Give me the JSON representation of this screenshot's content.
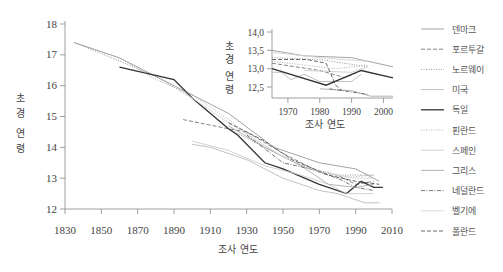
{
  "chart_data": [
    {
      "type": "line",
      "title": "",
      "xlabel": "조사 연도",
      "ylabel": "초경 연령",
      "xlim": [
        1830,
        2010
      ],
      "ylim": [
        12,
        18
      ],
      "x_ticks": [
        1830,
        1850,
        1870,
        1890,
        1910,
        1930,
        1950,
        1970,
        1990,
        2010
      ],
      "y_ticks": [
        12,
        13,
        14,
        15,
        16,
        17,
        18
      ],
      "grid": false,
      "legend_position": "right",
      "series": [
        {
          "name": "덴마크",
          "style": "solid",
          "color": "#9a9a9a",
          "points": [
            [
              1835,
              17.4
            ],
            [
              1860,
              16.9
            ],
            [
              1890,
              16.0
            ],
            [
              1920,
              15.1
            ],
            [
              1945,
              14.0
            ],
            [
              1950,
              13.9
            ],
            [
              1970,
              13.5
            ],
            [
              1990,
              13.3
            ],
            [
              2003,
              12.9
            ]
          ]
        },
        {
          "name": "포르투갈",
          "style": "dashed",
          "color": "#777777",
          "points": [
            [
              1895,
              14.9
            ],
            [
              1920,
              14.6
            ],
            [
              1930,
              14.5
            ],
            [
              1950,
              13.8
            ],
            [
              1970,
              13.2
            ],
            [
              1980,
              13.1
            ],
            [
              1990,
              12.8
            ],
            [
              2000,
              12.9
            ]
          ]
        },
        {
          "name": "노르웨이",
          "style": "dotted",
          "color": "#888888",
          "points": [
            [
              1835,
              17.4
            ],
            [
              1860,
              16.8
            ],
            [
              1880,
              16.3
            ],
            [
              1900,
              15.6
            ],
            [
              1920,
              14.6
            ],
            [
              1940,
              14.0
            ],
            [
              1960,
              13.4
            ],
            [
              1980,
              13.1
            ],
            [
              2000,
              13.1
            ]
          ]
        },
        {
          "name": "미국",
          "style": "solid",
          "color": "#bbbbbb",
          "points": [
            [
              1900,
              14.1
            ],
            [
              1910,
              14.0
            ],
            [
              1930,
              13.6
            ],
            [
              1950,
              13.0
            ],
            [
              1970,
              12.6
            ],
            [
              1980,
              12.5
            ],
            [
              1995,
              12.2
            ],
            [
              2003,
              12.2
            ]
          ]
        },
        {
          "name": "독일",
          "style": "solid",
          "color": "#333333",
          "points": [
            [
              1860,
              16.6
            ],
            [
              1890,
              16.2
            ],
            [
              1900,
              15.6
            ],
            [
              1920,
              14.6
            ],
            [
              1925,
              14.4
            ],
            [
              1940,
              13.5
            ],
            [
              1950,
              13.3
            ],
            [
              1970,
              12.8
            ],
            [
              1985,
              12.5
            ],
            [
              1993,
              12.9
            ],
            [
              2000,
              12.7
            ],
            [
              2005,
              12.7
            ]
          ]
        },
        {
          "name": "핀란드",
          "style": "dotted",
          "color": "#aaaaaa",
          "points": [
            [
              1840,
              17.3
            ],
            [
              1860,
              16.9
            ],
            [
              1880,
              16.2
            ],
            [
              1900,
              15.7
            ],
            [
              1920,
              14.9
            ],
            [
              1940,
              14.0
            ],
            [
              1960,
              13.4
            ],
            [
              1980,
              13.0
            ],
            [
              2000,
              13.1
            ]
          ]
        },
        {
          "name": "스페인",
          "style": "solid",
          "color": "#cccccc",
          "points": [
            [
              1900,
              14.2
            ],
            [
              1920,
              13.9
            ],
            [
              1940,
              13.4
            ],
            [
              1960,
              13.1
            ],
            [
              1975,
              12.8
            ],
            [
              1985,
              12.5
            ],
            [
              2000,
              12.5
            ]
          ]
        },
        {
          "name": "그리스",
          "style": "solid",
          "color": "#aaaaaa",
          "points": [
            [
              1920,
              14.7
            ],
            [
              1940,
              14.0
            ],
            [
              1960,
              13.4
            ],
            [
              1975,
              12.8
            ],
            [
              1990,
              12.7
            ],
            [
              2000,
              12.8
            ]
          ]
        },
        {
          "name": "네덜란드",
          "style": "dashdot",
          "color": "#666666",
          "points": [
            [
              1930,
              14.4
            ],
            [
              1950,
              13.5
            ],
            [
              1965,
              13.3
            ],
            [
              1980,
              13.0
            ],
            [
              1990,
              12.7
            ],
            [
              2000,
              12.6
            ]
          ]
        },
        {
          "name": "벨기에",
          "style": "solid",
          "color": "#d5d5d5",
          "points": [
            [
              1890,
              16.0
            ],
            [
              1920,
              14.8
            ],
            [
              1950,
              13.7
            ],
            [
              1970,
              13.2
            ],
            [
              1990,
              13.0
            ],
            [
              2000,
              13.0
            ]
          ]
        },
        {
          "name": "폴란드",
          "style": "dashed",
          "color": "#555555",
          "points": [
            [
              1920,
              14.8
            ],
            [
              1940,
              14.2
            ],
            [
              1955,
              13.6
            ],
            [
              1975,
              13.1
            ],
            [
              1990,
              12.9
            ],
            [
              2003,
              12.8
            ]
          ]
        }
      ]
    },
    {
      "type": "line",
      "title": "inset",
      "xlabel": "조사 연도",
      "ylabel": "초경 연령",
      "xlim": [
        1965,
        2003
      ],
      "ylim": [
        12.2,
        14.0
      ],
      "x_ticks": [
        1970,
        1980,
        1990,
        2000
      ],
      "y_ticks": [
        "12,5",
        "13,0",
        "13,5",
        "14,0"
      ],
      "grid": false,
      "series": [
        {
          "name": "덴마크",
          "style": "solid",
          "color": "#9a9a9a",
          "points": [
            [
              1965,
              13.5
            ],
            [
              1975,
              13.35
            ],
            [
              1990,
              13.3
            ],
            [
              2003,
              13.05
            ]
          ]
        },
        {
          "name": "포르투갈",
          "style": "dashed",
          "color": "#777777",
          "points": [
            [
              1965,
              13.15
            ],
            [
              1980,
              12.95
            ],
            [
              1988,
              12.75
            ],
            [
              1993,
              12.95
            ]
          ]
        },
        {
          "name": "노르웨이",
          "style": "dotted",
          "color": "#888888",
          "points": [
            [
              1965,
              13.3
            ],
            [
              1980,
              13.25
            ],
            [
              1995,
              13.05
            ]
          ]
        },
        {
          "name": "미국",
          "style": "solid",
          "color": "#bbbbbb",
          "points": [
            [
              1965,
              12.9
            ],
            [
              1968,
              12.9
            ],
            [
              1971,
              12.7
            ],
            [
              1975,
              12.85
            ],
            [
              1980,
              12.65
            ],
            [
              1990,
              12.65
            ],
            [
              1993,
              12.85
            ]
          ]
        },
        {
          "name": "독일",
          "style": "solid",
          "color": "#333333",
          "points": [
            [
              1965,
              13.0
            ],
            [
              1982,
              12.55
            ],
            [
              1993,
              12.95
            ],
            [
              2003,
              12.75
            ]
          ]
        },
        {
          "name": "핀란드",
          "style": "dotted",
          "color": "#aaaaaa",
          "points": [
            [
              1965,
              13.2
            ],
            [
              1985,
              13.0
            ],
            [
              1995,
              13.1
            ]
          ]
        },
        {
          "name": "스페인",
          "style": "solid",
          "color": "#cccccc",
          "points": [
            [
              1975,
              12.95
            ],
            [
              1990,
              12.9
            ],
            [
              1995,
              13.05
            ]
          ]
        },
        {
          "name": "그리스",
          "style": "solid",
          "color": "#aaaaaa",
          "points": [
            [
              1980,
              12.45
            ],
            [
              1990,
              12.4
            ],
            [
              1996,
              12.25
            ],
            [
              2003,
              12.25
            ]
          ]
        },
        {
          "name": "네덜란드",
          "style": "dashdot",
          "color": "#666666",
          "points": [
            [
              1983,
              12.45
            ],
            [
              1995,
              12.3
            ]
          ]
        },
        {
          "name": "벨기에",
          "style": "solid",
          "color": "#d5d5d5",
          "points": [
            [
              1965,
              13.45
            ],
            [
              1980,
              13.3
            ],
            [
              1995,
              13.2
            ]
          ]
        },
        {
          "name": "폴란드",
          "style": "dashed",
          "color": "#555555",
          "points": [
            [
              1965,
              13.25
            ],
            [
              1976,
              13.25
            ],
            [
              1982,
              13.15
            ],
            [
              1985,
              12.55
            ],
            [
              1987,
              12.4
            ]
          ]
        }
      ]
    }
  ],
  "legend": [
    {
      "label": "덴마크",
      "style": "solid",
      "color": "#9a9a9a"
    },
    {
      "label": "포르투갈",
      "style": "dashed",
      "color": "#777777"
    },
    {
      "label": "노르웨이",
      "style": "dotted",
      "color": "#888888"
    },
    {
      "label": "미국",
      "style": "solid",
      "color": "#bbbbbb"
    },
    {
      "label": "독일",
      "style": "solid",
      "color": "#333333"
    },
    {
      "label": "핀란드",
      "style": "dotted",
      "color": "#aaaaaa"
    },
    {
      "label": "스페인",
      "style": "solid",
      "color": "#cccccc"
    },
    {
      "label": "그리스",
      "style": "solid",
      "color": "#aaaaaa"
    },
    {
      "label": "네덜란드",
      "style": "dashdot",
      "color": "#666666"
    },
    {
      "label": "벨기에",
      "style": "solid",
      "color": "#d5d5d5"
    },
    {
      "label": "폴란드",
      "style": "dashed",
      "color": "#555555"
    }
  ],
  "main": {
    "xlabel": "조사 연도",
    "ylabel_chars": [
      "초",
      "경",
      "연",
      "령"
    ]
  },
  "inset": {
    "xlabel": "조사 연도",
    "ylabel_chars": [
      "초",
      "경",
      "연",
      "령"
    ]
  }
}
